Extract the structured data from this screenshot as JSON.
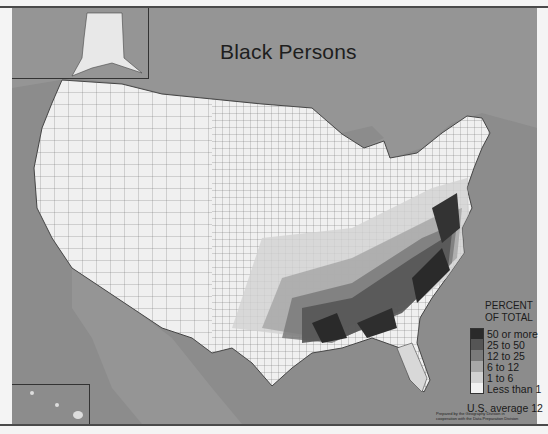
{
  "map": {
    "title": "Black Persons",
    "subject": "Percent of total population, by county, United States",
    "legend": {
      "title_line1": "PERCENT",
      "title_line2": "OF TOTAL",
      "items": [
        {
          "label": "50 or more",
          "color": "#2a2a2a"
        },
        {
          "label": "25 to 50",
          "color": "#555555"
        },
        {
          "label": "12 to 25",
          "color": "#7a7a7a"
        },
        {
          "label": "6 to 12",
          "color": "#a8a8a8"
        },
        {
          "label": "1 to 6",
          "color": "#d2d2d2"
        },
        {
          "label": "Less than 1",
          "color": "#f2f2f2"
        }
      ],
      "average": "U.S. average 12"
    },
    "credit_line1": "Prepared by the Geography Division in",
    "credit_line2": "cooperation with the Data Preparation Division",
    "insets": [
      "Alaska",
      "Hawaii"
    ],
    "colors": {
      "water": "#8c8c8c",
      "land_outside": "#9a9a9a",
      "border": "#4a4a4a"
    }
  }
}
